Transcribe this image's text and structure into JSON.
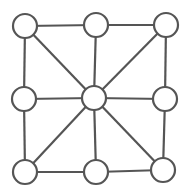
{
  "diagram": {
    "type": "graph",
    "colors": {
      "stroke": "#555555",
      "node_fill": "#ffffff",
      "background": "#ffffff"
    },
    "node_radius": 12,
    "nodes": [
      {
        "id": "top-left",
        "x": 25,
        "y": 26
      },
      {
        "id": "top-middle",
        "x": 96,
        "y": 25
      },
      {
        "id": "top-right",
        "x": 166,
        "y": 25
      },
      {
        "id": "middle-left",
        "x": 24,
        "y": 99
      },
      {
        "id": "center",
        "x": 94,
        "y": 98
      },
      {
        "id": "middle-right",
        "x": 165,
        "y": 99
      },
      {
        "id": "bottom-left",
        "x": 25,
        "y": 172
      },
      {
        "id": "bottom-middle",
        "x": 96,
        "y": 172
      },
      {
        "id": "bottom-right",
        "x": 163,
        "y": 170
      }
    ],
    "edges": [
      [
        "top-left",
        "top-middle"
      ],
      [
        "top-middle",
        "top-right"
      ],
      [
        "top-left",
        "middle-left"
      ],
      [
        "middle-left",
        "bottom-left"
      ],
      [
        "top-right",
        "middle-right"
      ],
      [
        "middle-right",
        "bottom-right"
      ],
      [
        "bottom-left",
        "bottom-middle"
      ],
      [
        "bottom-middle",
        "bottom-right"
      ],
      [
        "top-left",
        "center"
      ],
      [
        "top-middle",
        "center"
      ],
      [
        "top-right",
        "center"
      ],
      [
        "middle-left",
        "center"
      ],
      [
        "middle-right",
        "center"
      ],
      [
        "bottom-left",
        "center"
      ],
      [
        "bottom-middle",
        "center"
      ],
      [
        "bottom-right",
        "center"
      ]
    ]
  }
}
